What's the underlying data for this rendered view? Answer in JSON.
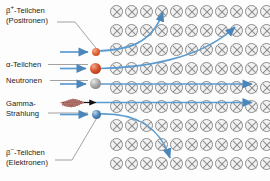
{
  "diagram": {
    "background_color": "#fdfdfd",
    "field": {
      "symbol_name": "magnetic-field-into-page",
      "symbol_glyph": "circle-with-cross",
      "columns": 11,
      "rows": 9,
      "stroke_color": "#8d8d8d",
      "fill_color": "#f2f2f2",
      "cell_spacing_x": 15,
      "cell_spacing_y": 19,
      "origin_x": 6,
      "origin_y": 5
    },
    "colors": {
      "beam_blue": "#5b9bd0",
      "gamma_dark_red": "#7d2318",
      "gamma_arrow": "#111111",
      "leader_line": "#6f6f6f",
      "text": "#1b1b1b",
      "positron": "#e2653c",
      "alpha": "#d9532c",
      "neutron": "#a8a8a8",
      "electron": "#4f86b8"
    },
    "labels": [
      {
        "id": "positron",
        "name": "label-positron",
        "line1_prefix": "β",
        "line1_sup": "+",
        "line1_suffix": "-Teilchen",
        "line2": "(Positronen)"
      },
      {
        "id": "alpha",
        "name": "label-alpha",
        "line1_prefix": "α-Teilchen",
        "line1_sup": "",
        "line1_suffix": "",
        "line2": ""
      },
      {
        "id": "neutron",
        "name": "label-neutron",
        "line1_prefix": "Neutronen",
        "line1_sup": "",
        "line1_suffix": "",
        "line2": ""
      },
      {
        "id": "gamma",
        "name": "label-gamma",
        "line1_prefix": "Gamma-",
        "line1_sup": "",
        "line1_suffix": "",
        "line2": "Strahlung"
      },
      {
        "id": "electron",
        "name": "label-electron",
        "line1_prefix": "β",
        "line1_sup": "−",
        "line1_suffix": "-Teilchen",
        "line2": "(Elektronen)"
      }
    ],
    "particles": [
      {
        "id": "positron",
        "label": "β+-Teilchen (Positronen)",
        "marker": "small-orange-sphere",
        "deflection": "upward",
        "charge": "positive"
      },
      {
        "id": "alpha",
        "label": "α-Teilchen",
        "marker": "large-orange-sphere",
        "deflection": "upward",
        "charge": "positive"
      },
      {
        "id": "neutron",
        "label": "Neutronen",
        "marker": "gray-sphere",
        "deflection": "none",
        "charge": "neutral"
      },
      {
        "id": "gamma",
        "label": "Gamma-Strahlung",
        "marker": "wave-packet",
        "deflection": "none",
        "charge": "neutral"
      },
      {
        "id": "electron",
        "label": "β−-Teilchen (Elektronen)",
        "marker": "small-blue-sphere",
        "deflection": "downward",
        "charge": "negative"
      }
    ]
  }
}
